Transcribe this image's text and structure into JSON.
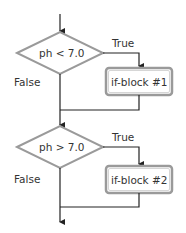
{
  "diagram": {
    "type": "flowchart",
    "colors": {
      "line": "#222222",
      "shape_border": "#9a9a9a",
      "text": "#333333",
      "background": "#ffffff"
    },
    "decisions": [
      {
        "id": "d1",
        "label": "ph < 7.0",
        "true_label": "True",
        "false_label": "False"
      },
      {
        "id": "d2",
        "label": "ph > 7.0",
        "true_label": "True",
        "false_label": "False"
      }
    ],
    "blocks": [
      {
        "id": "b1",
        "label": "if-block #1"
      },
      {
        "id": "b2",
        "label": "if-block #2"
      }
    ]
  }
}
